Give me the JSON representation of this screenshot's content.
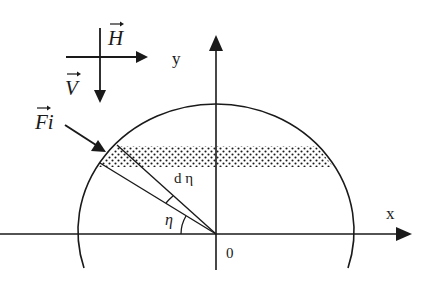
{
  "diagram": {
    "type": "half-ellipse wind-load geometry",
    "axes": {
      "x_label": "x",
      "y_label": "y",
      "origin_label": "0"
    },
    "vectors": {
      "horizontal": {
        "symbol": "H",
        "direction": "right"
      },
      "vertical": {
        "symbol": "V",
        "direction": "down"
      },
      "force": {
        "symbol": "Fi",
        "direction": "down-right toward boundary"
      }
    },
    "angles": {
      "eta": "η",
      "d_eta": "d η"
    },
    "shaded_strip": {
      "pattern": "dotted",
      "description": "horizontal strip between two parallel chords"
    },
    "colors": {
      "ink": "#1a1a1a",
      "background": "#ffffff"
    }
  }
}
